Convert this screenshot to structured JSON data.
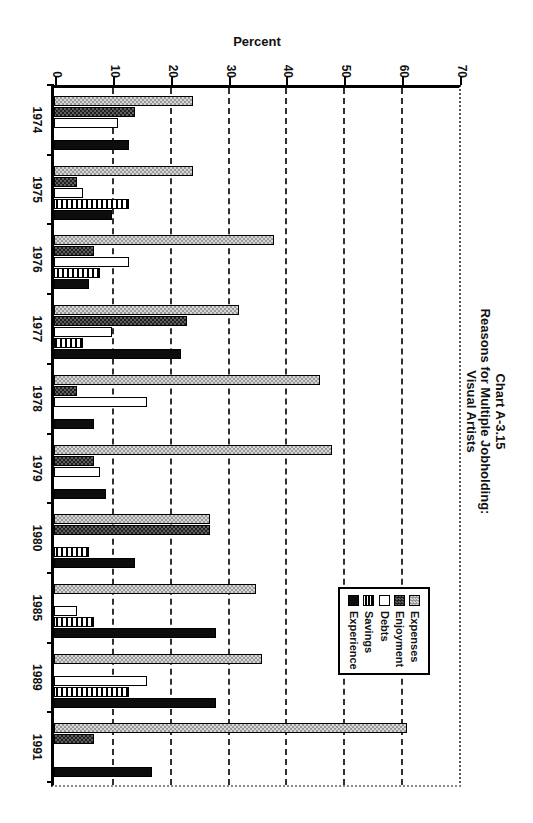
{
  "title": {
    "line1": "Chart A-3.15",
    "line2": "Reasons for Multiple Jobholding:",
    "line3": "Visual Artists"
  },
  "axis": {
    "percent_label": "Percent",
    "tick_labels": [
      "0",
      "10",
      "20",
      "30",
      "40",
      "50",
      "60",
      "70"
    ]
  },
  "legend": {
    "items": [
      "Expenses",
      "Enjoyment",
      "Debts",
      "Savings",
      "Experience"
    ]
  },
  "colors": {
    "bar_border": "#000000",
    "expenses_checker": [
      "#999999",
      "#d6d6d6"
    ],
    "enjoyment_checker": [
      "#1f1f1f",
      "#5f5f5f"
    ],
    "debts_fill": "#ffffff",
    "savings_stripe": "#000000",
    "experience_fill": "#0d0d0d",
    "grid_dash": "#1a1a1a"
  },
  "chart_data": {
    "type": "bar",
    "title": "Chart A-3.15 Reasons for Multiple Jobholding: Visual Artists",
    "note": "column chart printed rotated 90 degrees clockwise on the page",
    "xlabel": "",
    "ylabel": "Percent",
    "ylim": [
      0,
      70
    ],
    "yticks": [
      0,
      10,
      20,
      30,
      40,
      50,
      60,
      70
    ],
    "grid": "dashed lines at every 10 percent",
    "legend_position": "inside-upper-right",
    "categories": [
      "1974",
      "1975",
      "1976",
      "1977",
      "1978",
      "1979",
      "1980",
      "1985",
      "1989",
      "1991"
    ],
    "series": [
      {
        "name": "Expenses",
        "pattern": "light-gray-checker",
        "values": [
          24,
          24,
          38,
          32,
          46,
          48,
          27,
          35,
          36,
          61
        ]
      },
      {
        "name": "Enjoyment",
        "pattern": "dark-gray-checker",
        "values": [
          14,
          4,
          7,
          23,
          4,
          7,
          27,
          0,
          0,
          7
        ]
      },
      {
        "name": "Debts",
        "pattern": "white",
        "values": [
          11,
          5,
          13,
          10,
          16,
          8,
          0,
          4,
          16,
          0
        ]
      },
      {
        "name": "Savings",
        "pattern": "horizontal-stripes",
        "values": [
          0,
          13,
          8,
          5,
          0,
          0,
          6,
          7,
          13,
          0
        ]
      },
      {
        "name": "Experience",
        "pattern": "solid-black",
        "values": [
          13,
          10,
          6,
          22,
          7,
          9,
          14,
          28,
          28,
          17
        ]
      }
    ]
  }
}
